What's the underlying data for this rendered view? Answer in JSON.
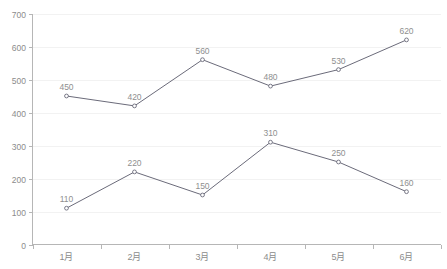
{
  "chart_data": {
    "type": "line",
    "title": "",
    "xlabel": "",
    "ylabel": "",
    "categories": [
      "1月",
      "2月",
      "3月",
      "4月",
      "5月",
      "6月"
    ],
    "yticks": [
      0,
      100,
      200,
      300,
      400,
      500,
      600,
      700
    ],
    "ytick_labels": [
      "0",
      "100",
      "200",
      "300",
      "400",
      "500",
      "600",
      "700"
    ],
    "ylim": [
      0,
      700
    ],
    "grid": true,
    "legend": "none",
    "series": [
      {
        "name": "series-upper",
        "color": "#6b6b7a",
        "values": [
          450,
          420,
          560,
          480,
          530,
          620
        ],
        "labels": [
          "450",
          "420",
          "560",
          "480",
          "530",
          "620"
        ]
      },
      {
        "name": "series-lower",
        "color": "#6b6b7a",
        "values": [
          110,
          220,
          150,
          310,
          250,
          160
        ],
        "labels": [
          "110",
          "220",
          "150",
          "310",
          "250",
          "160"
        ]
      }
    ]
  },
  "colors": {
    "background": "#ffffff",
    "grid": "#f2f2f2",
    "axis": "#b6b6b6",
    "line": "#6b6b7a",
    "label_text": "#8c8c8c"
  }
}
